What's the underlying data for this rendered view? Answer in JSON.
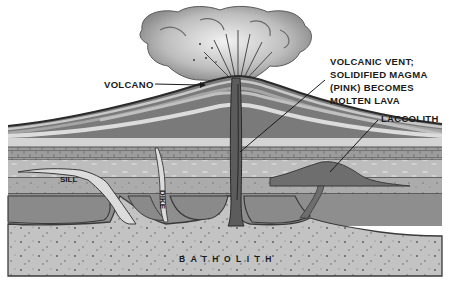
{
  "diagram": {
    "labels": {
      "volcano": "VOLCANO",
      "vent_line1": "VOLCANIC VENT;",
      "vent_line2": "SOLIDIFIED MAGMA",
      "vent_line3": "(PINK) BECOMES",
      "vent_line4": "MOLTEN LAVA",
      "laccolith": "LACCOLITH",
      "sill": "SILL",
      "dike": "DIKE",
      "batholith": "BATHOLITH"
    },
    "colors": {
      "background": "#ffffff",
      "ink": "#1a1a1a",
      "cloud_light": "#e6e6e6",
      "cloud_dark": "#8a8a8a",
      "layer_light": "#cfcfcf",
      "layer_mid": "#a8a8a8",
      "layer_dark": "#7c7c7c",
      "brick": "#9a9a9a",
      "magma": "#c4c4c4",
      "intrusion_dark": "#6e6e6e"
    }
  }
}
